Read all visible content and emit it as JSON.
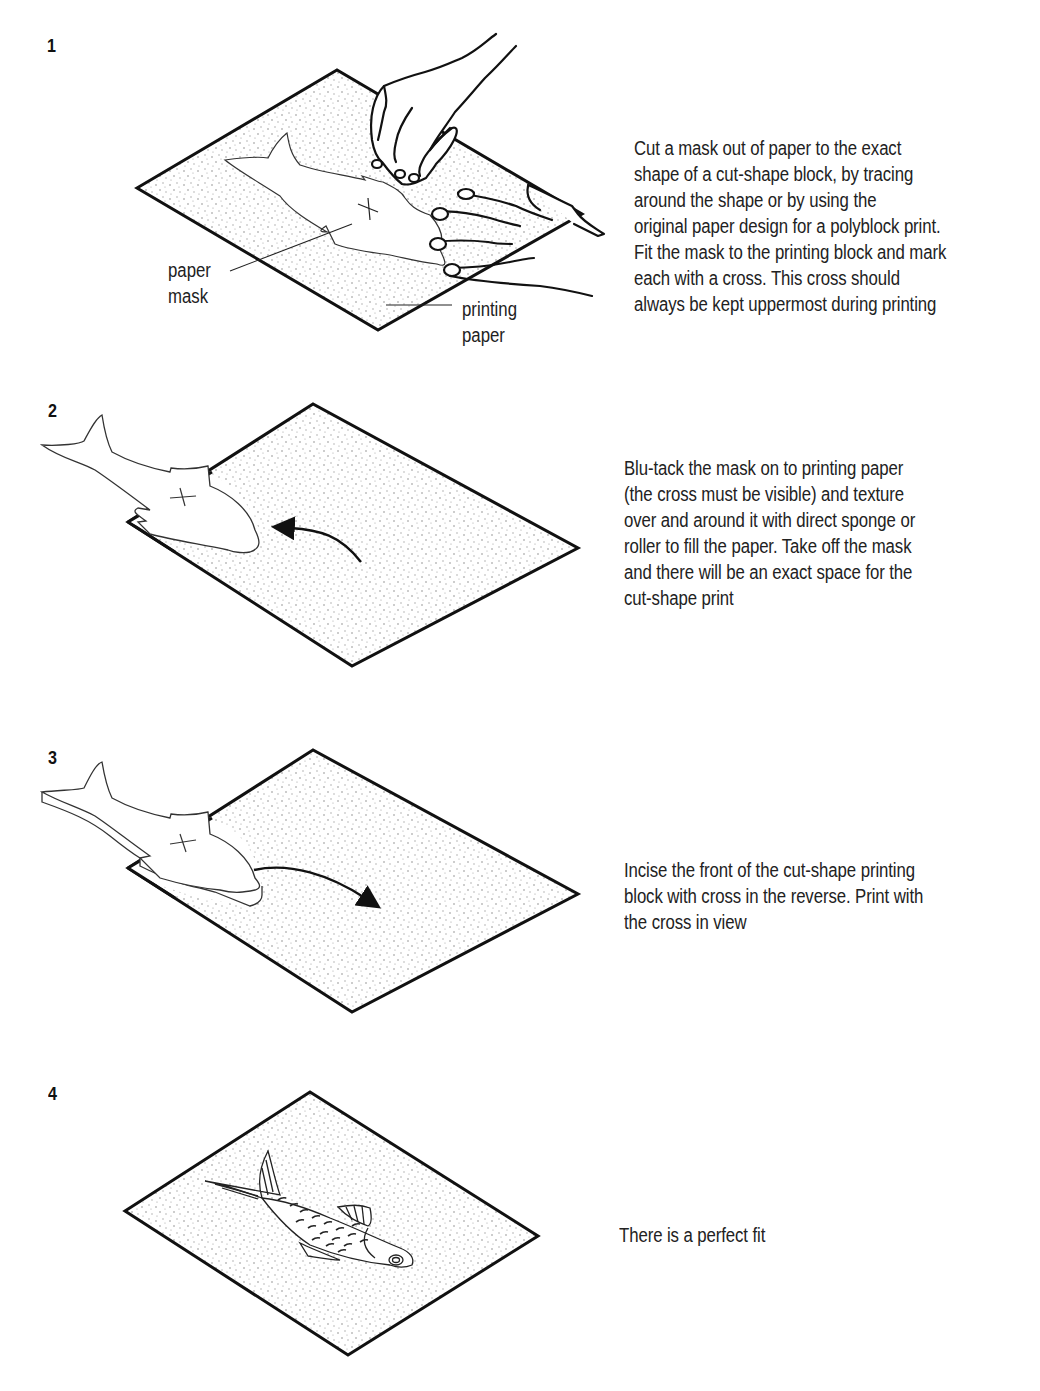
{
  "steps": [
    {
      "number": "1",
      "description": "Cut a mask out of paper to the exact\nshape of a cut-shape block, by tracing\naround the shape or by using the\noriginal paper design for a polyblock print.\nFit the mask to the printing block and mark\neach with a cross. This cross should\nalways be kept uppermost during printing",
      "labels": {
        "paper_mask": "paper\nmask",
        "printing_paper": "printing\npaper"
      },
      "illustration": "hands-tracing-paper-mask-on-printing-paper"
    },
    {
      "number": "2",
      "description": "Blu-tack the mask on to printing paper\n(the cross must be visible) and texture\nover and around it with direct sponge or\n roller to fill the paper. Take off the mask\nand there will be an exact space for the\ncut-shape print",
      "illustration": "mask-lifted-with-arrow"
    },
    {
      "number": "3",
      "description": "Incise the front of the cut-shape printing\nblock with cross in the reverse. Print with\nthe cross in view",
      "illustration": "block-placed-with-arrow"
    },
    {
      "number": "4",
      "description": "There is a perfect fit",
      "illustration": "printed-fish-on-textured-paper"
    }
  ],
  "colors": {
    "ink": "#111111",
    "text": "#222222",
    "stipple": "#9a9a9a",
    "background": "#ffffff"
  }
}
